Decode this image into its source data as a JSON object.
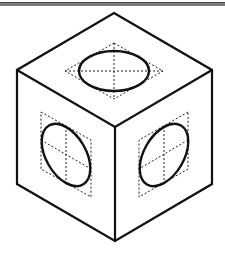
{
  "diagram": {
    "type": "isometric-drawing",
    "colors": {
      "background": "#ffffff",
      "line": "#111111",
      "construction": "#222222",
      "top_rule": "#7a7a7a"
    },
    "cube": {
      "vertices": {
        "top": [
          114,
          13
        ],
        "left_upper": [
          17,
          70
        ],
        "right_upper": [
          212,
          70
        ],
        "center": [
          115,
          127
        ],
        "left_lower": [
          17,
          184
        ],
        "right_lower": [
          212,
          184
        ],
        "bottom": [
          115,
          241
        ]
      }
    },
    "faces": [
      {
        "name": "top",
        "rhombus": [
          [
            114,
            43
          ],
          [
            163,
            71
          ],
          [
            114,
            99
          ],
          [
            65,
            71
          ]
        ],
        "ellipse": {
          "cx": 114,
          "cy": 71,
          "rx": 35,
          "ry": 20,
          "rotate": 0
        }
      },
      {
        "name": "left",
        "rhombus": [
          [
            41,
            112
          ],
          [
            91,
            140
          ],
          [
            91,
            197
          ],
          [
            41,
            169
          ]
        ],
        "ellipse": {
          "cx": 66,
          "cy": 155,
          "rx": 35,
          "ry": 20,
          "rotate": 60
        }
      },
      {
        "name": "right",
        "rhombus": [
          [
            188,
            112
          ],
          [
            139,
            140
          ],
          [
            139,
            197
          ],
          [
            188,
            169
          ]
        ],
        "ellipse": {
          "cx": 164,
          "cy": 155,
          "rx": 35,
          "ry": 20,
          "rotate": -60
        }
      }
    ]
  }
}
